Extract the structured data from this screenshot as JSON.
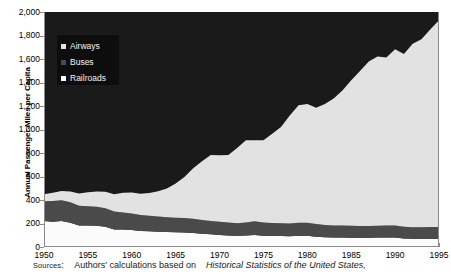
{
  "figure": {
    "title_fragment": "",
    "ylabel": "Annual Passenger-Miles per Capita",
    "source_prefix": "Sources",
    "source_colon": ":",
    "source_text_a": "Authors' calculations based on",
    "source_text_italic": "Historical Statistics of the United States,"
  },
  "legend": {
    "items": [
      {
        "label": "Airways",
        "color": "#e2e2e2"
      },
      {
        "label": "Buses",
        "color": "#4a4a4a"
      },
      {
        "label": "Railroads",
        "color": "#fbfbfb"
      }
    ],
    "background": "#0d0d0d",
    "text_color": "#f2f2f2"
  },
  "axes": {
    "y_ticks": [
      "0",
      "200",
      "400",
      "600",
      "800",
      "1,000",
      "1,200",
      "1,400",
      "1,600",
      "1,800",
      "2,000"
    ],
    "x_ticks": [
      "1950",
      "1955",
      "1960",
      "1965",
      "1970",
      "1975",
      "1980",
      "1985",
      "1990",
      "1995"
    ],
    "ylim": [
      0,
      2000
    ],
    "xlim": [
      1950,
      1995
    ],
    "axis_color": "#8a8a8a"
  },
  "chart_data": {
    "type": "area",
    "title": "",
    "xlabel": "",
    "ylabel": "Annual Passenger-Miles per Capita",
    "ylim": [
      0,
      2000
    ],
    "xlim": [
      1950,
      1995
    ],
    "grid": false,
    "stacked": true,
    "legend_position": "upper-left-inside",
    "x": [
      1950,
      1951,
      1952,
      1953,
      1954,
      1955,
      1956,
      1957,
      1958,
      1959,
      1960,
      1961,
      1962,
      1963,
      1964,
      1965,
      1966,
      1967,
      1968,
      1969,
      1970,
      1971,
      1972,
      1973,
      1974,
      1975,
      1976,
      1977,
      1978,
      1979,
      1980,
      1981,
      1982,
      1983,
      1984,
      1985,
      1986,
      1987,
      1988,
      1989,
      1990,
      1991,
      1992,
      1993,
      1994,
      1995
    ],
    "series": [
      {
        "name": "Railroads",
        "color": "#fbfbfb",
        "values": [
          222,
          215,
          222,
          206,
          184,
          182,
          180,
          172,
          150,
          148,
          144,
          136,
          133,
          130,
          128,
          126,
          124,
          120,
          113,
          108,
          103,
          98,
          95,
          98,
          103,
          96,
          94,
          93,
          92,
          96,
          95,
          87,
          82,
          80,
          80,
          79,
          78,
          79,
          80,
          81,
          80,
          72,
          70,
          69,
          70,
          68
        ]
      },
      {
        "name": "Buses",
        "color": "#4a4a4a",
        "values": [
          167,
          176,
          175,
          174,
          168,
          165,
          162,
          158,
          152,
          146,
          142,
          137,
          134,
          130,
          126,
          124,
          122,
          120,
          117,
          114,
          112,
          110,
          108,
          110,
          116,
          112,
          110,
          109,
          108,
          110,
          112,
          108,
          105,
          103,
          102,
          101,
          100,
          100,
          101,
          102,
          102,
          100,
          99,
          100,
          101,
          102
        ]
      },
      {
        "name": "Airways",
        "color": "#e2e2e2",
        "values": [
          61,
          70,
          80,
          92,
          104,
          118,
          130,
          140,
          146,
          168,
          178,
          180,
          192,
          214,
          244,
          290,
          350,
          430,
          500,
          560,
          565,
          575,
          640,
          700,
          690,
          700,
          760,
          820,
          920,
          1000,
          1010,
          990,
          1030,
          1080,
          1150,
          1240,
          1320,
          1400,
          1440,
          1430,
          1500,
          1470,
          1560,
          1600,
          1680,
          1760
        ]
      }
    ],
    "top_fill": {
      "name": "Remainder (to axis maximum)",
      "color": "#1a1a1a",
      "note": "black region filling the plot area above the stacked series up to 2,000"
    }
  }
}
